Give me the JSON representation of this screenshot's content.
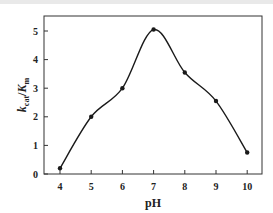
{
  "chart_data": {
    "type": "line",
    "title": "",
    "xlabel": "pH",
    "ylabel": "k_cat/K_m",
    "ylabel_parts": {
      "k": "k",
      "k_sub": "cat",
      "slash": "/",
      "K": "K",
      "K_sub": "m"
    },
    "x": [
      4,
      5,
      6,
      7,
      8,
      9,
      10
    ],
    "series": [
      {
        "name": "kcat/Km",
        "values": [
          0.2,
          2.0,
          3.0,
          5.05,
          3.55,
          2.55,
          0.75
        ],
        "marker": "circle",
        "smooth": true,
        "color": "#1a1a1a"
      }
    ],
    "xticks": [
      "4",
      "5",
      "6",
      "7",
      "8",
      "9",
      "10"
    ],
    "yticks": [
      "0",
      "1",
      "2",
      "3",
      "4",
      "5"
    ],
    "xlim": [
      3.5,
      10.5
    ],
    "ylim": [
      0,
      5.5
    ],
    "grid": false,
    "legend": null
  }
}
